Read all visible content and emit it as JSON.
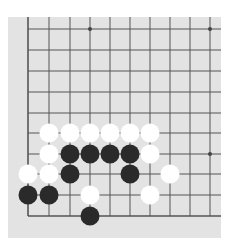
{
  "board": {
    "colors": {
      "background": "#e3e3e3",
      "line": "#555555",
      "black": "#2a2a2a",
      "white": "#ffffff"
    },
    "grid": {
      "x": [
        28,
        49,
        70,
        90,
        110,
        130,
        150,
        170,
        190,
        210
      ],
      "y": [
        29,
        50,
        71,
        92,
        113,
        133,
        154,
        174,
        195,
        216
      ]
    },
    "star_points": [
      [
        3,
        0
      ],
      [
        9,
        0
      ],
      [
        9,
        6
      ]
    ],
    "stones": [
      {
        "color": "white",
        "col": 1,
        "row": 5
      },
      {
        "color": "white",
        "col": 2,
        "row": 5
      },
      {
        "color": "white",
        "col": 3,
        "row": 5
      },
      {
        "color": "white",
        "col": 4,
        "row": 5
      },
      {
        "color": "white",
        "col": 5,
        "row": 5
      },
      {
        "color": "white",
        "col": 6,
        "row": 5
      },
      {
        "color": "white",
        "col": 1,
        "row": 6
      },
      {
        "color": "black",
        "col": 2,
        "row": 6
      },
      {
        "color": "black",
        "col": 3,
        "row": 6
      },
      {
        "color": "black",
        "col": 4,
        "row": 6
      },
      {
        "color": "black",
        "col": 5,
        "row": 6
      },
      {
        "color": "white",
        "col": 6,
        "row": 6
      },
      {
        "color": "white",
        "col": 0,
        "row": 7
      },
      {
        "color": "white",
        "col": 1,
        "row": 7
      },
      {
        "color": "black",
        "col": 2,
        "row": 7
      },
      {
        "color": "black",
        "col": 5,
        "row": 7
      },
      {
        "color": "white",
        "col": 7,
        "row": 7
      },
      {
        "color": "black",
        "col": 0,
        "row": 8
      },
      {
        "color": "black",
        "col": 1,
        "row": 8
      },
      {
        "color": "white",
        "col": 3,
        "row": 8
      },
      {
        "color": "white",
        "col": 6,
        "row": 8
      },
      {
        "color": "black",
        "col": 3,
        "row": 9
      }
    ]
  }
}
